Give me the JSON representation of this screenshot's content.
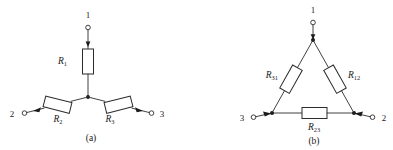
{
  "figure": {
    "type": "circuit-diagram",
    "background_color": "#ffffff",
    "line_color": "#2b2b2b",
    "panels": [
      {
        "id": "panel-a",
        "caption": "(a)",
        "topology": "star",
        "terminals": [
          {
            "name": "terminal-1",
            "label": "1",
            "position": "top"
          },
          {
            "name": "terminal-2",
            "label": "2",
            "position": "bottom-left"
          },
          {
            "name": "terminal-3",
            "label": "3",
            "position": "bottom-right"
          }
        ],
        "resistors": [
          {
            "name": "resistor-r1",
            "symbol": "R",
            "subscript": "1",
            "branch": "terminal-1 to center-node",
            "orientation": "vertical"
          },
          {
            "name": "resistor-r2",
            "symbol": "R",
            "subscript": "2",
            "branch": "center-node to terminal-2",
            "orientation": "diagonal-down-left"
          },
          {
            "name": "resistor-r3",
            "symbol": "R",
            "subscript": "3",
            "branch": "center-node to terminal-3",
            "orientation": "diagonal-down-right"
          }
        ],
        "junction": "center-node"
      },
      {
        "id": "panel-b",
        "caption": "(b)",
        "topology": "delta",
        "terminals": [
          {
            "name": "terminal-1",
            "label": "1",
            "position": "top"
          },
          {
            "name": "terminal-2",
            "label": "2",
            "position": "bottom-right"
          },
          {
            "name": "terminal-3",
            "label": "3",
            "position": "bottom-left"
          }
        ],
        "resistors": [
          {
            "name": "resistor-r31",
            "symbol": "R",
            "subscript": "31",
            "branch": "node-3 to node-1",
            "orientation": "diagonal-left-side"
          },
          {
            "name": "resistor-r12",
            "symbol": "R",
            "subscript": "12",
            "branch": "node-1 to node-2",
            "orientation": "diagonal-right-side"
          },
          {
            "name": "resistor-r23",
            "symbol": "R",
            "subscript": "23",
            "branch": "node-2 to node-3",
            "orientation": "horizontal-bottom"
          }
        ],
        "junction": "three-corner-nodes"
      }
    ]
  }
}
